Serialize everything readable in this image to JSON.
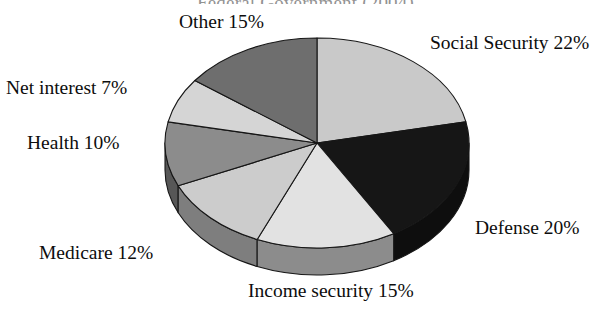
{
  "chart_data": {
    "type": "pie",
    "title": "Federal Government (2004)",
    "xlabel": "",
    "ylabel": "",
    "legend_position": "none",
    "grid": false,
    "labels": [
      "Social Security",
      "Defense",
      "Income security",
      "Medicare",
      "Health",
      "Net interest",
      "Other"
    ],
    "values": [
      22,
      20,
      15,
      12,
      10,
      7,
      15
    ],
    "value_unit": "%",
    "colors": [
      "#c9c9c9",
      "#161616",
      "#e2e2e2",
      "#cccccc",
      "#8c8c8c",
      "#d5d5d5",
      "#6e6e6e"
    ],
    "slices": [
      {
        "label": "Social Security",
        "value": 22,
        "display": "Social Security 22%",
        "color": "#c9c9c9"
      },
      {
        "label": "Defense",
        "value": 20,
        "display": "Defense 20%",
        "color": "#161616"
      },
      {
        "label": "Income security",
        "value": 15,
        "display": "Income security 15%",
        "color": "#e2e2e2"
      },
      {
        "label": "Medicare",
        "value": 12,
        "display": "Medicare 12%",
        "color": "#cccccc"
      },
      {
        "label": "Health",
        "value": 10,
        "display": "Health 10%",
        "color": "#8c8c8c"
      },
      {
        "label": "Net interest",
        "value": 7,
        "display": "Net interest 7%",
        "color": "#d5d5d5"
      },
      {
        "label": "Other",
        "value": 15,
        "display": "Other 15%",
        "color": "#6e6e6e"
      }
    ]
  },
  "labels": {
    "title": "Federal Government (2004)",
    "social_security": "Social Security 22%",
    "defense": "Defense 20%",
    "income_security": "Income security 15%",
    "medicare": "Medicare 12%",
    "health": "Health 10%",
    "net_interest": "Net interest 7%",
    "other": "Other 15%"
  }
}
